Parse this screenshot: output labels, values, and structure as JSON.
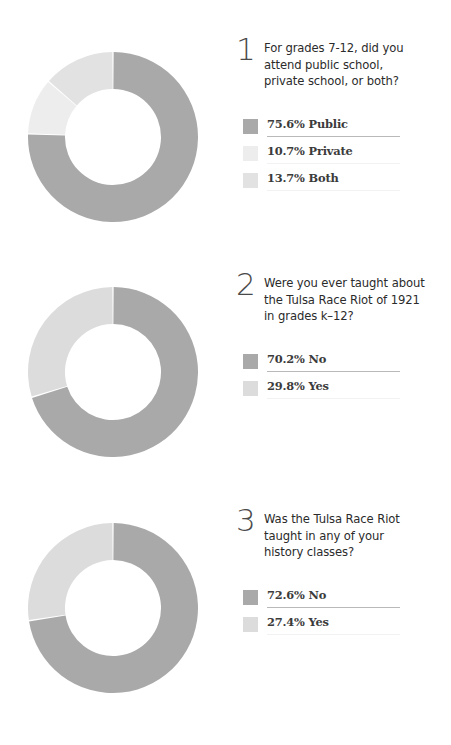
{
  "palette": {
    "dark": "#a9a9a9",
    "light": "#dcdcdc",
    "lightest": "#ededed",
    "background": "#ffffff",
    "text": "#2b2b2b",
    "numeral": "#4a4a4a",
    "rule_strong": "#b9b9b9",
    "rule_faint": "#f2f2f2"
  },
  "questions": [
    {
      "number": "1",
      "text": "For grades 7-12, did you\nattend public school,\nprivate school, or both?",
      "legend": [
        {
          "pct": "75.6%",
          "label": "Public",
          "swatch": "#a9a9a9",
          "rule": "strong"
        },
        {
          "pct": "10.7%",
          "label": "Private",
          "swatch": "#ededed",
          "rule": "faint"
        },
        {
          "pct": "13.7%",
          "label": "Both",
          "swatch": "#e2e2e2",
          "rule": "faint"
        }
      ]
    },
    {
      "number": "2",
      "text": "Were you ever taught about\nthe Tulsa Race Riot of 1921\nin grades k–12?",
      "legend": [
        {
          "pct": "70.2%",
          "label": "No",
          "swatch": "#a9a9a9",
          "rule": "strong"
        },
        {
          "pct": "29.8%",
          "label": "Yes",
          "swatch": "#dcdcdc",
          "rule": "faint"
        }
      ]
    },
    {
      "number": "3",
      "text": "Was the Tulsa Race Riot\ntaught in any of your\nhistory classes?",
      "legend": [
        {
          "pct": "72.6%",
          "label": "No",
          "swatch": "#a9a9a9",
          "rule": "strong"
        },
        {
          "pct": "27.4%",
          "label": "Yes",
          "swatch": "#dcdcdc",
          "rule": "faint"
        }
      ]
    }
  ],
  "chart_data": [
    {
      "type": "pie",
      "variant": "donut",
      "title": "For grades 7-12, did you attend public school, private school, or both?",
      "categories": [
        "Public",
        "Private",
        "Both"
      ],
      "values": [
        75.6,
        10.7,
        13.7
      ],
      "unit": "percent",
      "colors": [
        "#a9a9a9",
        "#ededed",
        "#e2e2e2"
      ],
      "start_angle_deg": 0,
      "direction": "clockwise",
      "inner_radius_ratio": 0.565,
      "legend_position": "right"
    },
    {
      "type": "pie",
      "variant": "donut",
      "title": "Were you ever taught about the Tulsa Race Riot of 1921 in grades k–12?",
      "categories": [
        "No",
        "Yes"
      ],
      "values": [
        70.2,
        29.8
      ],
      "unit": "percent",
      "colors": [
        "#a9a9a9",
        "#dcdcdc"
      ],
      "start_angle_deg": 0,
      "direction": "clockwise",
      "inner_radius_ratio": 0.565,
      "legend_position": "right"
    },
    {
      "type": "pie",
      "variant": "donut",
      "title": "Was the Tulsa Race Riot taught in any of your history classes?",
      "categories": [
        "No",
        "Yes"
      ],
      "values": [
        72.6,
        27.4
      ],
      "unit": "percent",
      "colors": [
        "#a9a9a9",
        "#dcdcdc"
      ],
      "start_angle_deg": 0,
      "direction": "clockwise",
      "inner_radius_ratio": 0.565,
      "legend_position": "right"
    }
  ]
}
